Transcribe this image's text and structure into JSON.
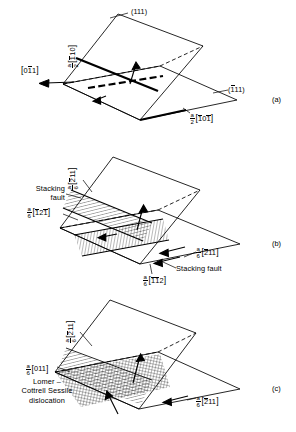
{
  "figure": {
    "type": "crystallographic-dislocation-diagram",
    "line_color": "#000000",
    "background": "#ffffff"
  },
  "panels": [
    {
      "id": "a",
      "letter": "(a)",
      "planes": [
        {
          "name": "upper-plane-label",
          "text": "(111)"
        },
        {
          "name": "right-plane-label",
          "text": "(",
          "bar": "1",
          "rest": "11)"
        }
      ],
      "labels": {
        "plane_top": "(111)",
        "plane_right_pre": "(",
        "plane_right_bar": "1",
        "plane_right_post": "11)",
        "burgers_upper_num": "a",
        "burgers_upper_den": "2",
        "burgers_upper_bar": "1",
        "burgers_upper_rest": "10",
        "direction_left_pre": "0",
        "direction_left_bar": "1",
        "direction_left_post": "1",
        "burgers_lower_num": "a",
        "burgers_lower_den": "2",
        "burgers_lower_b1": "1",
        "burgers_lower_mid": "0",
        "burgers_lower_b2": "1"
      }
    },
    {
      "id": "b",
      "letter": "(b)",
      "labels": {
        "burgers_top_num": "a",
        "burgers_top_den": "6",
        "burgers_top_bar": "2",
        "burgers_top_rest": "11",
        "stacking_fault_upper_line1": "Stacking",
        "stacking_fault_upper_line2": "fault",
        "burgers_left_num": "a",
        "burgers_left_den": "6",
        "burgers_left_b1": "1",
        "burgers_left_mid": "2",
        "burgers_left_b2": "1",
        "burgers_right_num": "a",
        "burgers_right_den": "6",
        "burgers_right_bar": "2",
        "burgers_right_rest": "11",
        "stacking_fault_lower": "Stacking  fault",
        "burgers_bottom_num": "a",
        "burgers_bottom_den": "6",
        "burgers_bottom_b1": "1",
        "burgers_bottom_b2": "1",
        "burgers_bottom_post": "2"
      }
    },
    {
      "id": "c",
      "letter": "(c)",
      "labels": {
        "burgers_top_num": "a",
        "burgers_top_den": "6",
        "burgers_top_bar": "2",
        "burgers_top_rest": "11",
        "burgers_left_num": "a",
        "burgers_left_den": "6",
        "burgers_left_rest": "011",
        "lomer_line1": "Lomer –",
        "lomer_line2": "Cottrell Sessile",
        "lomer_line3": "dislocation",
        "burgers_right_num": "a",
        "burgers_right_den": "6",
        "burgers_right_bar": "2",
        "burgers_right_rest": "11"
      }
    }
  ]
}
